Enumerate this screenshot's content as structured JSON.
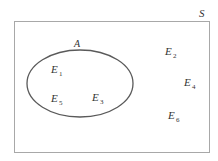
{
  "diagram": {
    "type": "venn",
    "colors": {
      "background": "#ffffff",
      "sample_space_stroke": "#a8a8a8",
      "set_stroke": "#5a5a5a",
      "text": "#333333"
    },
    "sample_space": {
      "label": "S",
      "x": 14,
      "y": 21,
      "width": 195,
      "height": 131
    },
    "sets": [
      {
        "label": "A",
        "cx": 80,
        "cy": 83.5,
        "rx": 53,
        "ry": 33.5,
        "label_x": 77,
        "label_y": 46
      }
    ],
    "outcomes": [
      {
        "base": "E",
        "sub": "1",
        "x": 51,
        "y": 73,
        "in_set": "A"
      },
      {
        "base": "E",
        "sub": "5",
        "x": 51,
        "y": 102,
        "in_set": "A"
      },
      {
        "base": "E",
        "sub": "3",
        "x": 92,
        "y": 101,
        "in_set": "A"
      },
      {
        "base": "E",
        "sub": "2",
        "x": 165,
        "y": 55,
        "in_set": null
      },
      {
        "base": "E",
        "sub": "4",
        "x": 184,
        "y": 86,
        "in_set": null
      },
      {
        "base": "E",
        "sub": "6",
        "x": 168,
        "y": 119,
        "in_set": null
      }
    ]
  }
}
